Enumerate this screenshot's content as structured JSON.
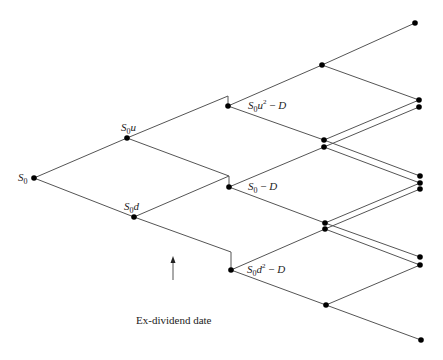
{
  "diagram": {
    "line_color": "#555555",
    "node_color": "#000000",
    "labels": {
      "s0": "S0",
      "s0u": "S0u",
      "s0d": "S0d",
      "s0u2_minus_d": "S0u2 − D",
      "s0_minus_d": "S0 − D",
      "s0d2_minus_d": "S0d2 − D"
    },
    "caption": "Ex-dividend date",
    "nodes": [
      {
        "id": "S0",
        "x": 34,
        "y": 178
      },
      {
        "id": "S0u",
        "x": 127,
        "y": 138
      },
      {
        "id": "S0d",
        "x": 134,
        "y": 217
      },
      {
        "id": "A",
        "x": 228,
        "y": 106
      },
      {
        "id": "B",
        "x": 229,
        "y": 187
      },
      {
        "id": "C",
        "x": 231,
        "y": 270
      },
      {
        "id": "A_u",
        "x": 322,
        "y": 65
      },
      {
        "id": "A_d",
        "x": 324,
        "y": 140
      },
      {
        "id": "B_u",
        "x": 324,
        "y": 147
      },
      {
        "id": "B_d",
        "x": 325,
        "y": 223
      },
      {
        "id": "C_u",
        "x": 325,
        "y": 229
      },
      {
        "id": "C_d",
        "x": 326,
        "y": 305
      },
      {
        "id": "R1",
        "x": 415,
        "y": 23
      },
      {
        "id": "R2",
        "x": 419,
        "y": 100
      },
      {
        "id": "R3",
        "x": 419,
        "y": 107
      },
      {
        "id": "R4",
        "x": 420,
        "y": 176
      },
      {
        "id": "R5",
        "x": 420,
        "y": 183
      },
      {
        "id": "R6",
        "x": 420,
        "y": 189
      },
      {
        "id": "R7",
        "x": 420,
        "y": 257
      },
      {
        "id": "R8",
        "x": 420,
        "y": 265
      },
      {
        "id": "R9",
        "x": 421,
        "y": 340
      }
    ]
  }
}
